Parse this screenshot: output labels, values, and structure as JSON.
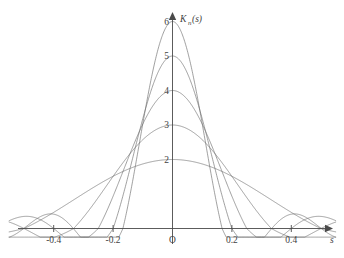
{
  "chart_data": {
    "type": "line",
    "title": "",
    "xlabel": "s",
    "ylabel": "K_n(s)",
    "ylabel_base": "K",
    "ylabel_sub": "n",
    "ylabel_arg": "(s)",
    "origin_label": "O",
    "grid": false,
    "legend": "none",
    "xlim": [
      -0.55,
      0.55
    ],
    "ylim": [
      -0.4,
      6.4
    ],
    "xticks": [
      -0.4,
      -0.2,
      0.2,
      0.4
    ],
    "xtick_labels": [
      "-0.4",
      "-0.2",
      "0.2",
      "0.4"
    ],
    "yticks": [
      2,
      3,
      4,
      5,
      6
    ],
    "ytick_labels": [
      "2",
      "3",
      "4",
      "5",
      "6"
    ],
    "series": [
      {
        "name": "n=2",
        "peak": 2,
        "peak_x": 0,
        "first_zero": 0.5,
        "lobes": 2
      },
      {
        "name": "n=3",
        "peak": 3,
        "peak_x": 0,
        "first_zero": 0.333,
        "lobes": 3
      },
      {
        "name": "n=4",
        "peak": 4,
        "peak_x": 0,
        "first_zero": 0.25,
        "lobes": 4
      },
      {
        "name": "n=5",
        "peak": 5,
        "peak_x": 0,
        "first_zero": 0.2,
        "lobes": 5
      },
      {
        "name": "n=6",
        "peak": 6,
        "peak_x": 0,
        "first_zero": 0.167,
        "lobes": 6
      }
    ]
  },
  "colors": {
    "curve": "#6e6e6e",
    "axis": "#4a4a4a",
    "text": "#3f3f3f",
    "background": "#ffffff"
  }
}
